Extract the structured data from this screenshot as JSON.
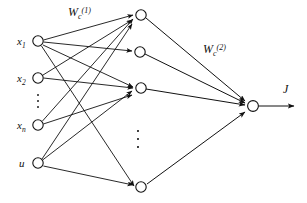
{
  "diagram": {
    "type": "feedforward-neural-network",
    "colors": {
      "background": "#ffffff",
      "stroke": "#111111",
      "node_fill": "#ffffff"
    },
    "layers": {
      "input": {
        "name": "input-layer",
        "nodes": [
          {
            "id": "x1",
            "label_base": "x",
            "label_sub": "1",
            "cx": 38,
            "cy": 41
          },
          {
            "id": "x2",
            "label_base": "x",
            "label_sub": "2",
            "cx": 38,
            "cy": 78
          },
          {
            "id": "xn",
            "label_base": "x",
            "label_sub": "n",
            "cx": 38,
            "cy": 125
          },
          {
            "id": "u",
            "label_base": "u",
            "label_sub": "",
            "cx": 38,
            "cy": 163
          }
        ],
        "ellipsis": {
          "cx": 38,
          "cy": 101,
          "label": "vertical-ellipsis"
        }
      },
      "hidden": {
        "name": "hidden-layer",
        "nodes": [
          {
            "id": "h1",
            "cx": 141,
            "cy": 15
          },
          {
            "id": "h2",
            "cx": 140,
            "cy": 52
          },
          {
            "id": "h3",
            "cx": 141,
            "cy": 88
          },
          {
            "id": "h4",
            "cx": 141,
            "cy": 187
          }
        ],
        "ellipsis": {
          "cx": 138,
          "cy": 139,
          "label": "vertical-ellipsis"
        }
      },
      "output": {
        "name": "output-layer",
        "nodes": [
          {
            "id": "out",
            "cx": 253,
            "cy": 106
          }
        ]
      }
    },
    "labels": {
      "weight1": {
        "base": "W",
        "sub": "c",
        "sup": "(1)",
        "x": 68,
        "y": 16
      },
      "weight2": {
        "base": "W",
        "sub": "c",
        "sup": "(2)",
        "x": 203,
        "y": 53
      },
      "output": {
        "text": "J",
        "x": 285,
        "y": 92
      }
    },
    "node_radius": 5.2,
    "edges_input_to_hidden": [
      {
        "from": "x1",
        "to": "h1"
      },
      {
        "from": "x1",
        "to": "h2"
      },
      {
        "from": "x1",
        "to": "h3"
      },
      {
        "from": "x1",
        "to": "h4"
      },
      {
        "from": "x2",
        "to": "h1"
      },
      {
        "from": "x2",
        "to": "h3"
      },
      {
        "from": "xn",
        "to": "h1"
      },
      {
        "from": "xn",
        "to": "h3"
      },
      {
        "from": "u",
        "to": "h1"
      },
      {
        "from": "u",
        "to": "h3"
      },
      {
        "from": "u",
        "to": "h4"
      }
    ],
    "edges_hidden_to_output": [
      {
        "from": "h1",
        "to": "out"
      },
      {
        "from": "h2",
        "to": "out"
      },
      {
        "from": "h3",
        "to": "out"
      },
      {
        "from": "h4",
        "to": "out"
      }
    ],
    "output_arrow": {
      "from_x": 258,
      "to_x": 296,
      "y": 106
    }
  }
}
